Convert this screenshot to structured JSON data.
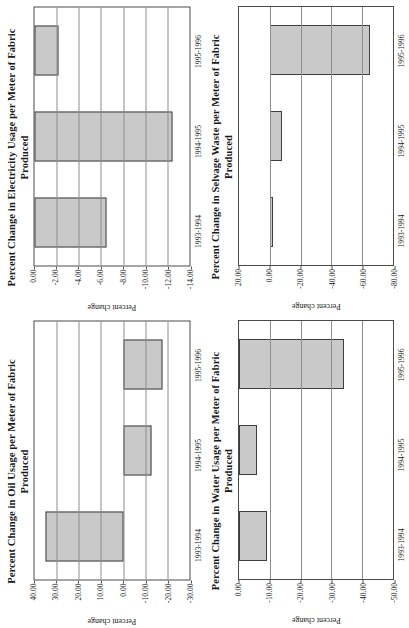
{
  "figure": {
    "panel_count": 4,
    "bar_fill_color": "#c9c9c9",
    "bar_edge_color": "#3d3d3d"
  },
  "chart_data": [
    {
      "type": "bar",
      "panel": "top-left",
      "title": "Percent Change in Electricity Usage per Meter of Fabric Produced",
      "xlabel": "",
      "ylabel": "Percent change",
      "categories": [
        "1993-1994",
        "1994-1995",
        "1995-1996"
      ],
      "values": [
        -6.5,
        -12.5,
        -2.2
      ],
      "ylim": [
        0.0,
        -14.0
      ],
      "yticks": [
        "0.00",
        "-2.00",
        "-4.00",
        "-6.00",
        "-8.00",
        "-10.00",
        "-12.00",
        "-14.00"
      ],
      "ytick_values": [
        0,
        -2,
        -4,
        -6,
        -8,
        -10,
        -12,
        -14
      ],
      "grid": true,
      "legend": "none",
      "rotated_degrees": -90
    },
    {
      "type": "bar",
      "panel": "top-right",
      "title": "Percent Change in Selvage Waste per Meter of Fabric Produced",
      "xlabel": "",
      "ylabel": "Percent change",
      "categories": [
        "1993-1994",
        "1994-1995",
        "1995-1996"
      ],
      "values": [
        -2.0,
        -8.0,
        -65.0
      ],
      "ylim": [
        20.0,
        -80.0
      ],
      "yticks": [
        "20.00",
        "0.00",
        "-20.00",
        "-40.00",
        "-60.00",
        "-80.00"
      ],
      "ytick_values": [
        20,
        0,
        -20,
        -40,
        -60,
        -80
      ],
      "grid": true,
      "legend": "none",
      "rotated_degrees": -90
    },
    {
      "type": "bar",
      "panel": "bottom-left",
      "title": "Percent Change in Oil Usage per Meter of Fabric Produced",
      "xlabel": "",
      "ylabel": "Percent change",
      "categories": [
        "1993-1994",
        "1994-1995",
        "1995-1996"
      ],
      "values": [
        35.0,
        -13.0,
        -18.0
      ],
      "ylim": [
        40.0,
        -30.0
      ],
      "yticks": [
        "40.00",
        "30.00",
        "20.00",
        "10.00",
        "0.00",
        "-10.00",
        "-20.00",
        "-30.00"
      ],
      "ytick_values": [
        40,
        30,
        20,
        10,
        0,
        -10,
        -20,
        -30
      ],
      "grid": true,
      "legend": "none",
      "rotated_degrees": -90
    },
    {
      "type": "bar",
      "panel": "bottom-right",
      "title": "Percent Change in Water Usage per Meter of Fabric Produced",
      "xlabel": "",
      "ylabel": "Percent change",
      "categories": [
        "1993-1994",
        "1994-1995",
        "1995-1996"
      ],
      "values": [
        -9.0,
        -6.0,
        -34.0
      ],
      "ylim": [
        0.0,
        -50.0
      ],
      "yticks": [
        "0.00",
        "-10.00",
        "-20.00",
        "-30.00",
        "-40.00",
        "-50.00"
      ],
      "ytick_values": [
        0,
        -10,
        -20,
        -30,
        -40,
        -50
      ],
      "grid": true,
      "legend": "none",
      "rotated_degrees": -90
    }
  ]
}
